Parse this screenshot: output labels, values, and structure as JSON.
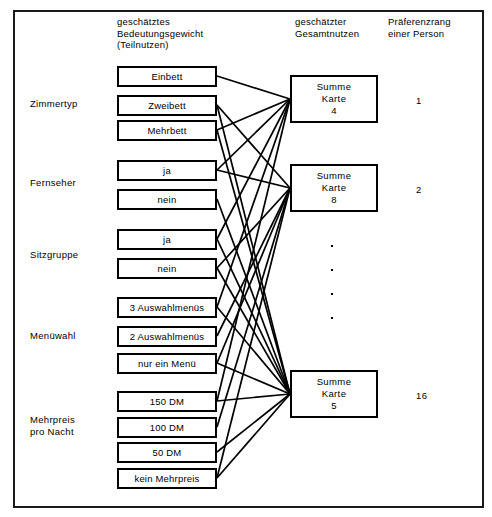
{
  "headers": {
    "weight": "geschätztes\nBedeutungsgewicht\n(Teilnutzen)",
    "total": "geschätzter\nGesamtnutzen",
    "rank": "Präferenzrang\neiner Person"
  },
  "attributes": [
    {
      "label": "Zimmertyp",
      "levels": [
        "Einbett",
        "Zweibett",
        "Mehrbett"
      ]
    },
    {
      "label": "Fernseher",
      "levels": [
        "ja",
        "nein"
      ]
    },
    {
      "label": "Sitzgruppe",
      "levels": [
        "ja",
        "nein"
      ]
    },
    {
      "label": "Menüwahl",
      "levels": [
        "3 Auswahlmenüs",
        "2 Auswahlmenüs",
        "nur ein Menü"
      ]
    },
    {
      "label": "Mehrpreis\npro Nacht",
      "levels": [
        "150 DM",
        "100 DM",
        "50 DM",
        "kein Mehrpreis"
      ]
    }
  ],
  "sums": [
    {
      "line1": "Summe",
      "line2": "Karte",
      "line3": "4",
      "rank": "1"
    },
    {
      "line1": "Summe",
      "line2": "Karte",
      "line3": "8",
      "rank": "2"
    },
    {
      "line1": "Summe",
      "line2": "Karte",
      "line3": "5",
      "rank": "16"
    }
  ],
  "ellipsis_dots": 4,
  "colors": {
    "ink": "#000000",
    "frame": "#1a1a1a",
    "paper": "#ffffff"
  }
}
